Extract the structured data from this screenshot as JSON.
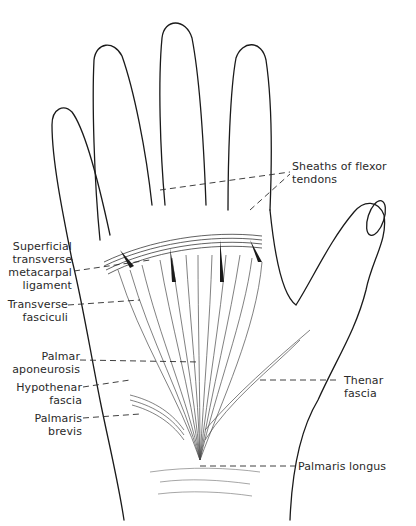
{
  "figure": {
    "colors": {
      "line": "#1a1a1a",
      "fiber": "#4a4a4a",
      "background": "#ffffff",
      "text": "#2a2a2a"
    }
  },
  "labels": {
    "sheaths": {
      "line1": "Sheaths of flexor",
      "line2": "tendons"
    },
    "superficial": {
      "line1": "Superficial",
      "line2": "transverse",
      "line3": "metacarpal",
      "line4": "ligament"
    },
    "transverse": {
      "line1": "Transverse",
      "line2": "fasciculi"
    },
    "palmar_apo": {
      "line1": "Palmar",
      "line2": "aponeurosis"
    },
    "hypothenar": {
      "line1": "Hypothenar",
      "line2": "fascia"
    },
    "palmaris_brevis": {
      "line1": "Palmaris",
      "line2": "brevis"
    },
    "thenar": {
      "line1": "Thenar",
      "line2": "fascia"
    },
    "palmaris_longus": {
      "line1": "Palmaris longus"
    }
  }
}
